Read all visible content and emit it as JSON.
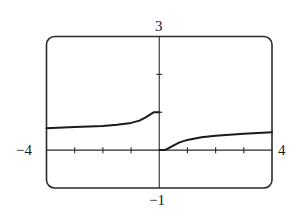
{
  "chart_data": {
    "type": "line",
    "title": "",
    "xlabel": "",
    "ylabel": "",
    "xlim": [
      -4,
      4
    ],
    "ylim": [
      -1,
      3
    ],
    "grid": false,
    "legend": null,
    "x_ticks": [
      -3,
      -2,
      -1,
      1,
      2,
      3
    ],
    "y_ticks": [
      1,
      2
    ],
    "window_labels": {
      "xmin": "−4",
      "xmax": "4",
      "ymin": "−1",
      "ymax": "3"
    },
    "series": [
      {
        "name": "left branch (x < 0)",
        "x": [
          -4,
          -3,
          -2,
          -1.5,
          -1,
          -0.7,
          -0.5,
          -0.3,
          -0.2,
          0
        ],
        "y": [
          0.58,
          0.61,
          0.64,
          0.67,
          0.72,
          0.78,
          0.86,
          0.95,
          1.0,
          1.0
        ]
      },
      {
        "name": "right branch (x > 0)",
        "x": [
          0,
          0.2,
          0.5,
          0.7,
          1,
          1.5,
          2,
          3,
          4
        ],
        "y": [
          0,
          0.0,
          0.12,
          0.2,
          0.27,
          0.34,
          0.38,
          0.43,
          0.47
        ]
      }
    ],
    "annotations": [
      "open/closed jump discontinuity at x = 0: left limit 1, right limit 0"
    ]
  },
  "style": {
    "stroke": "#1a1a1a",
    "background": "#ffffff"
  }
}
